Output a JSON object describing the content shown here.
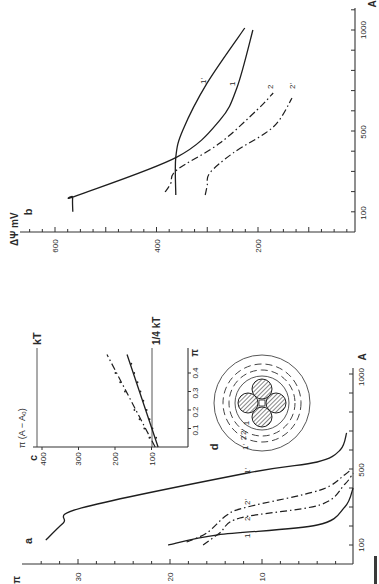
{
  "figure": {
    "caption_fragment": "FIGURE"
  },
  "chart_data": [
    {
      "panel": "b",
      "type": "line",
      "orientation": "rotated 90° counter-clockwise",
      "title": "",
      "xlabel": "A",
      "ylabel": "ΔΨ mV",
      "panel_label": "b",
      "x_ticks": [
        100,
        500,
        1000
      ],
      "y_ticks": [
        600,
        400,
        200
      ],
      "xlim": [
        0,
        1000
      ],
      "ylim": [
        0,
        700
      ],
      "grid": false,
      "legend": "inline curve labels",
      "series": [
        {
          "name": "1",
          "style": "solid",
          "points": [
            [
              100,
              565
            ],
            [
              173,
              565
            ],
            [
              180,
              557
            ],
            [
              371,
              360
            ],
            [
              554,
              275
            ],
            [
              718,
              241
            ],
            [
              1000,
              210
            ]
          ]
        },
        {
          "name": "1'",
          "style": "solid",
          "points": [
            [
              183,
              362
            ],
            [
              371,
              362
            ],
            [
              505,
              348
            ],
            [
              738,
              300
            ],
            [
              1010,
              226
            ]
          ]
        },
        {
          "name": "2",
          "style": "dash-dot",
          "points": [
            [
              198,
              383
            ],
            [
              240,
              372
            ],
            [
              307,
              360
            ],
            [
              440,
              275
            ],
            [
              604,
              202
            ],
            [
              688,
              170
            ]
          ]
        },
        {
          "name": "2'",
          "style": "dash-dot",
          "points": [
            [
              183,
              304
            ],
            [
              230,
              300
            ],
            [
              292,
              295
            ],
            [
              391,
              249
            ],
            [
              520,
              170
            ],
            [
              663,
              133
            ]
          ]
        }
      ]
    },
    {
      "panel": "a",
      "type": "line",
      "orientation": "rotated 90° counter-clockwise",
      "title": "",
      "xlabel": "A",
      "ylabel": "π",
      "panel_label": "a",
      "x_ticks": [
        100,
        500,
        1000
      ],
      "y_ticks": [
        30,
        20,
        10
      ],
      "xlim": [
        0,
        1000
      ],
      "ylim": [
        0,
        38
      ],
      "grid": false,
      "legend": "inline curve labels",
      "series": [
        {
          "name": "1",
          "style": "solid",
          "points": [
            [
              100,
              20.2
            ],
            [
              153,
              14.8
            ],
            [
              205,
              4.0
            ],
            [
              300,
              1.0
            ],
            [
              400,
              0.1
            ]
          ]
        },
        {
          "name": "2",
          "style": "dash-dot",
          "points": [
            [
              100,
              16.4
            ],
            [
              163,
              14.6
            ],
            [
              242,
              12.4
            ],
            [
              311,
              3.7
            ],
            [
              420,
              1.0
            ],
            [
              479,
              0.1
            ]
          ]
        },
        {
          "name": "2'",
          "style": "dash-dot",
          "points": [
            [
              116,
              18.2
            ],
            [
              163,
              16.0
            ],
            [
              258,
              13.8
            ],
            [
              300,
              11.6
            ],
            [
              389,
              3.7
            ],
            [
              470,
              1.0
            ],
            [
              495,
              0.4
            ]
          ]
        },
        {
          "name": "1'",
          "style": "solid",
          "points": [
            [
              126,
              33.5
            ],
            [
              216,
              31.6
            ],
            [
              295,
              29.6
            ],
            [
              479,
              11.6
            ],
            [
              537,
              4.0
            ],
            [
              600,
              1.5
            ],
            [
              690,
              0.8
            ]
          ]
        }
      ]
    },
    {
      "panel": "c",
      "type": "scatter",
      "orientation": "rotated 90° counter-clockwise",
      "title": "",
      "xlabel": "π",
      "ylabel": "π (A − A₀)",
      "panel_label": "c",
      "x_ticks": [
        "0.1",
        "0.2",
        "0.3",
        "0.4"
      ],
      "y_ticks": [
        100,
        200,
        300,
        400
      ],
      "xlim": [
        0,
        0.5
      ],
      "ylim": [
        0,
        420
      ],
      "grid": false,
      "reference_lines": [
        {
          "label": "kT",
          "value": 413
        },
        {
          "label": "1/4 kT",
          "value": 100
        }
      ],
      "series": [
        {
          "name": "solid fit",
          "style": "solid",
          "line": [
            [
              0,
              82
            ],
            [
              0.5,
              167
            ]
          ],
          "points": [
            [
              0.05,
              90
            ],
            [
              0.1,
              100
            ],
            [
              0.15,
              108
            ],
            [
              0.2,
              116
            ],
            [
              0.25,
              125
            ],
            [
              0.3,
              133
            ],
            [
              0.35,
              141
            ],
            [
              0.4,
              150
            ],
            [
              0.45,
              158
            ]
          ]
        },
        {
          "name": "dash-dot fit",
          "style": "dash-dot",
          "line": [
            [
              0,
              90
            ],
            [
              0.5,
              222
            ]
          ],
          "points": [
            [
              0.05,
              103
            ],
            [
              0.1,
              117
            ],
            [
              0.15,
              130
            ],
            [
              0.2,
              144
            ],
            [
              0.3,
              170
            ],
            [
              0.35,
              183
            ],
            [
              0.4,
              196
            ]
          ]
        }
      ]
    },
    {
      "panel": "d",
      "type": "diagram",
      "panel_label": "d",
      "description": "Four hatched spheres in a square arrangement surrounded by concentric shells (dashed inner shells, solid outer circle)",
      "shell_labels": [
        "1'",
        "2",
        "2'",
        "1"
      ]
    }
  ]
}
